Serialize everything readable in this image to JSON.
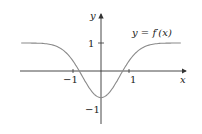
{
  "chart_data": {
    "type": "line",
    "title": "",
    "annotation": "y = f′(x)",
    "xlabel": "x",
    "ylabel": "y",
    "x_ticks": [
      {
        "value": -1,
        "label": "−1"
      },
      {
        "value": 1,
        "label": "1"
      }
    ],
    "y_ticks": [
      {
        "value": 1,
        "label": "1"
      },
      {
        "value": -1,
        "label": "−1"
      }
    ],
    "xlim": [
      -2.9,
      2.9
    ],
    "ylim": [
      -1.7,
      1.9
    ],
    "grid": false,
    "legend": null,
    "series": [
      {
        "name": "f'(x)",
        "x": [
          -2.8,
          -2.4,
          -2.0,
          -1.6,
          -1.3,
          -1.0,
          -0.7,
          -0.4,
          0.0,
          0.4,
          0.7,
          1.0,
          1.3,
          1.6,
          2.0,
          2.4,
          2.8
        ],
        "y": [
          1.0,
          0.99,
          0.95,
          0.78,
          0.5,
          0.0,
          -0.45,
          -0.8,
          -0.95,
          -0.8,
          -0.45,
          0.0,
          0.5,
          0.78,
          0.95,
          0.99,
          1.0
        ]
      }
    ],
    "colors": {
      "curve": "#8a8a8a",
      "axes": "#333333"
    }
  }
}
